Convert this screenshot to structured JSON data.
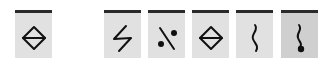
{
  "palette": {
    "current": {
      "symbol": "diamond-bar-icon",
      "pressed": false
    },
    "buttons": [
      {
        "symbol": "zigzag-icon",
        "pressed": false
      },
      {
        "symbol": "slash-dots-icon",
        "pressed": false
      },
      {
        "symbol": "diamond-bar-icon",
        "pressed": false
      },
      {
        "symbol": "vertical-wave-icon",
        "pressed": false
      },
      {
        "symbol": "wave-dot-icon",
        "pressed": true
      }
    ]
  },
  "colors": {
    "button_bg": "#e1e1e1",
    "button_pressed_bg": "#cfcfcf",
    "top_bar": "#2a2a2a",
    "glyph": "#111111"
  }
}
